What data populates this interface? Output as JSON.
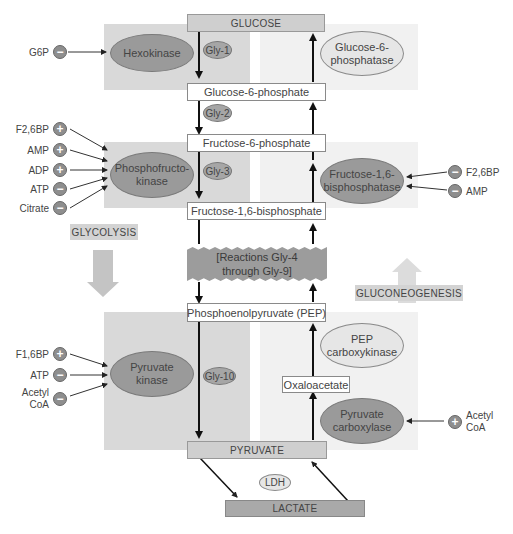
{
  "metabolites": {
    "glucose": "Glucose",
    "g6p": "Glucose-6-phosphate",
    "f6p": "Fructose-6-phosphate",
    "f16bp": "Fructose-1,6-bisphosphate",
    "pep": "Phosphoenolpyruvate (PEP)",
    "oxaloacetate": "Oxaloacetate",
    "pyruvate": "Pyruvate",
    "lactate": "Lactate"
  },
  "middle_block": {
    "line1": "[Reactions Gly-4",
    "line2": "through Gly-9]"
  },
  "enzymes": {
    "hexokinase": "Hexokinase",
    "pfk_line1": "Phosphofructo-",
    "pfk_line2": "kinase",
    "pk_line1": "Pyruvate",
    "pk_line2": "kinase",
    "g6pase_line1": "Glucose-6-",
    "g6pase_line2": "phosphatase",
    "fbpase_line1": "Fructose-1,6-",
    "fbpase_line2": "bisphosphatase",
    "pepck_line1": "PEP",
    "pepck_line2": "carboxykinase",
    "pc_line1": "Pyruvate",
    "pc_line2": "carboxylase",
    "ldh": "LDH"
  },
  "steps": {
    "gly1": "Gly-1",
    "gly2": "Gly-2",
    "gly3": "Gly-3",
    "gly10": "Gly-10"
  },
  "pathway_labels": {
    "glycolysis": "Glycolysis",
    "gluconeogenesis": "Gluconeogenesis"
  },
  "regulators": {
    "hexokinase": [
      {
        "name": "G6P",
        "sign": "−"
      }
    ],
    "pfk": [
      {
        "name": "F2,6BP",
        "sign": "+"
      },
      {
        "name": "AMP",
        "sign": "+"
      },
      {
        "name": "ADP",
        "sign": "+"
      },
      {
        "name": "ATP",
        "sign": "−"
      },
      {
        "name": "Citrate",
        "sign": "−"
      }
    ],
    "pk": [
      {
        "name": "F1,6BP",
        "sign": "+"
      },
      {
        "name": "ATP",
        "sign": "−"
      },
      {
        "name": "Acetyl",
        "name2": "CoA",
        "sign": "−"
      }
    ],
    "fbpase": [
      {
        "name": "F2,6BP",
        "sign": "−"
      },
      {
        "name": "AMP",
        "sign": "−"
      }
    ],
    "pc": [
      {
        "name": "Acetyl",
        "name2": "CoA",
        "sign": "+"
      }
    ]
  },
  "colors": {
    "glycolysis_panel": "#d9d9d9",
    "gluconeogenesis_panel": "#f1f1f1",
    "enzyme_dark": "#9a9a9a",
    "enzyme_light": "#e6e6e6",
    "arrow": "#111111"
  }
}
